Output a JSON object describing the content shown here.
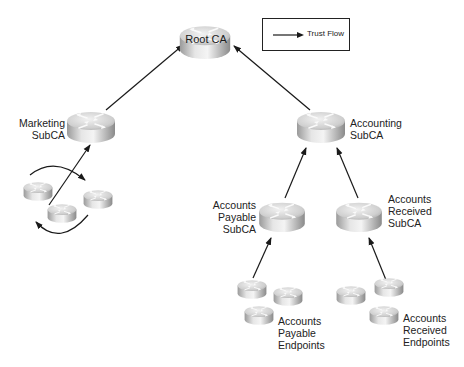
{
  "diagram": {
    "type": "PKI trust hierarchy",
    "legend": {
      "label": "Trust Flow",
      "symbol": "arrow-right"
    },
    "nodes": {
      "root_ca": {
        "label": "Root CA"
      },
      "marketing_subca": {
        "label_line1": "Marketing",
        "label_line2": "SubCA"
      },
      "accounting_subca": {
        "label_line1": "Accounting",
        "label_line2": "SubCA"
      },
      "accounts_payable_subca": {
        "label_line1": "Accounts",
        "label_line2": "Payable",
        "label_line3": "SubCA"
      },
      "accounts_received_subca": {
        "label_line1": "Accounts",
        "label_line2": "Received",
        "label_line3": "SubCA"
      },
      "accounts_payable_endpoints": {
        "label_line1": "Accounts",
        "label_line2": "Payable",
        "label_line3": "Endpoints"
      },
      "accounts_received_endpoints": {
        "label_line1": "Accounts",
        "label_line2": "Received",
        "label_line3": "Endpoints"
      },
      "marketing_endpoints": {
        "count": 3
      }
    },
    "edges": [
      {
        "from": "Marketing SubCA",
        "to": "Root CA"
      },
      {
        "from": "Accounting SubCA",
        "to": "Root CA"
      },
      {
        "from": "Marketing Endpoints",
        "to": "Marketing SubCA"
      },
      {
        "from": "Accounts Payable SubCA",
        "to": "Accounting SubCA"
      },
      {
        "from": "Accounts Received SubCA",
        "to": "Accounting SubCA"
      },
      {
        "from": "Accounts Payable Endpoints",
        "to": "Accounts Payable SubCA"
      },
      {
        "from": "Accounts Received Endpoints",
        "to": "Accounts Received SubCA"
      }
    ],
    "colors": {
      "line": "#1a1a1a",
      "router_light": "#e8e8e8",
      "router_dark": "#8c8c8c"
    }
  }
}
